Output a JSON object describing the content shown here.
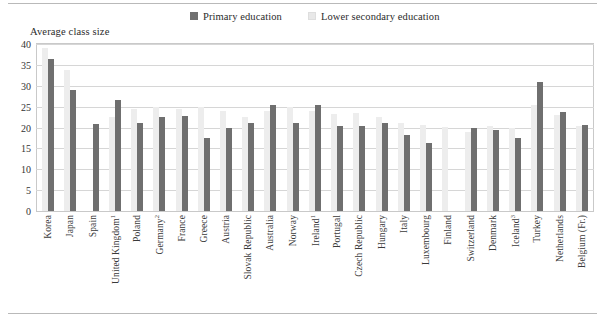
{
  "axis_title": "Average class size",
  "legend": {
    "entries": [
      {
        "label": "Primary education",
        "color": "#6f6f6f",
        "key": "primary"
      },
      {
        "label": "Lower secondary education",
        "color": "#ededed",
        "key": "lower"
      }
    ]
  },
  "colors": {
    "primary_bar": "#6f6f6f",
    "lower_bar": "#ededed",
    "gridline": "#d6d6d6",
    "frame": "#c9c9c9",
    "rule": "#b9b9b9",
    "text": "#2b2b2b"
  },
  "chart_data": {
    "type": "bar",
    "title": "",
    "subtitle": "",
    "xlabel": "",
    "ylabel": "Average class size",
    "ylim": [
      0,
      40
    ],
    "yticks": [
      0,
      5,
      10,
      15,
      20,
      25,
      30,
      35,
      40
    ],
    "ytick_labels": [
      "0",
      "5",
      "10",
      "15",
      "20",
      "25",
      "30",
      "35",
      "40"
    ],
    "grid": true,
    "legend_position": "top-center",
    "categories": [
      "Korea",
      "Japan",
      "Spain",
      "United Kingdom¹",
      "Poland",
      "Germany²",
      "France",
      "Greece",
      "Austria",
      "Slovak Republic",
      "Australia",
      "Norway",
      "Ireland¹",
      "Portugal",
      "Czech Republic",
      "Hungary",
      "Italy",
      "Luxembourg",
      "Finland",
      "Switzerland",
      "Denmark",
      "Iceland³",
      "Turkey",
      "Netherlands",
      "Belgium (Fr.)"
    ],
    "category_footnotes": {
      "United Kingdom": "1",
      "Germany": "2",
      "Ireland": "1",
      "Iceland": "3"
    },
    "series": [
      {
        "name": "Primary education",
        "color": "#6f6f6f",
        "values": [
          36.5,
          29.0,
          20.8,
          26.5,
          21.0,
          22.4,
          22.8,
          17.5,
          20.0,
          21.2,
          25.5,
          21.0,
          25.5,
          20.3,
          20.3,
          21.0,
          18.3,
          16.2,
          null,
          19.8,
          19.3,
          17.5,
          30.8,
          23.7,
          20.5
        ]
      },
      {
        "name": "Lower secondary education",
        "color": "#ededed",
        "values": [
          39.0,
          33.8,
          null,
          22.6,
          24.5,
          24.8,
          24.5,
          25.0,
          24.0,
          22.5,
          24.0,
          25.0,
          24.0,
          23.3,
          23.5,
          22.5,
          21.2,
          20.5,
          20.2,
          19.0,
          20.3,
          19.8,
          25.5,
          23.0,
          20.3
        ]
      }
    ]
  }
}
